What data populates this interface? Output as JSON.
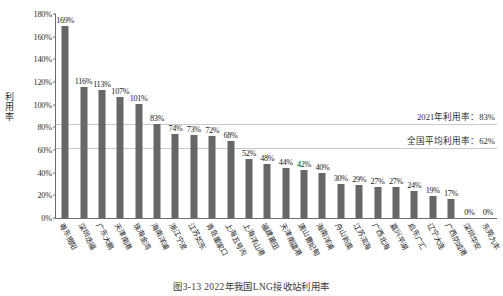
{
  "chart_data": {
    "type": "bar",
    "title": "图3-13  2022年我国LNG接收站利用率",
    "xlabel": "",
    "ylabel": "利用率",
    "ylim": [
      0,
      180
    ],
    "ytick_step": 20,
    "grid": false,
    "bar_color": "#676767",
    "categories": [
      "粤东揭阳",
      "深圳迭福",
      "广东大鹏",
      "天津南港",
      "珠海金湾",
      "海南洋浦",
      "浙江宁波",
      "江苏如东",
      "青岛董家口",
      "上海五号沟",
      "上海洋山港",
      "福建莆田",
      "天津南疆港",
      "唐山曹妃甸",
      "海南洋浦",
      "舟山新奥",
      "江苏滨海",
      "广西北海",
      "嘉兴平湖",
      "启东广汇",
      "辽宁大连",
      "广西防城港",
      "深圳华安",
      "东莞九丰"
    ],
    "values": [
      169,
      116,
      113,
      107,
      101,
      83,
      74,
      73,
      72,
      68,
      52,
      48,
      44,
      42,
      40,
      30,
      29,
      27,
      27,
      24,
      19,
      17,
      0,
      0
    ],
    "value_labels": [
      "169%",
      "116%",
      "113%",
      "107%",
      "101%",
      "83%",
      "74%",
      "73%",
      "72%",
      "68%",
      "52%",
      "48%",
      "44%",
      "42%",
      "40%",
      "30%",
      "29%",
      "27%",
      "27%",
      "24%",
      "19%",
      "17%",
      "0%",
      "0%"
    ],
    "ytick_labels": [
      "0%",
      "20%",
      "40%",
      "60%",
      "80%",
      "100%",
      "120%",
      "140%",
      "160%",
      "180%"
    ],
    "reference_lines": [
      {
        "value": 83,
        "label": "2021年利用率：83%",
        "color": "#c9c9c9"
      },
      {
        "value": 62,
        "label": "全国平均利用率：62%",
        "color": "#c9c9c9"
      }
    ]
  },
  "caption": "图3-13  2022年我国LNG接收站利用率"
}
